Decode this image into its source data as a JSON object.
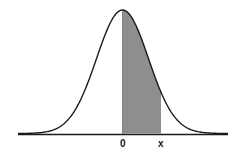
{
  "diagram": {
    "type": "normal-distribution-curve",
    "shaded_region": {
      "from_label": "0",
      "to_label": "x"
    },
    "labels": {
      "zero": "0",
      "x": "x"
    },
    "colors": {
      "curve": "#1a1a1a",
      "shade": "#8e8e8e",
      "background": "#ffffff"
    }
  }
}
